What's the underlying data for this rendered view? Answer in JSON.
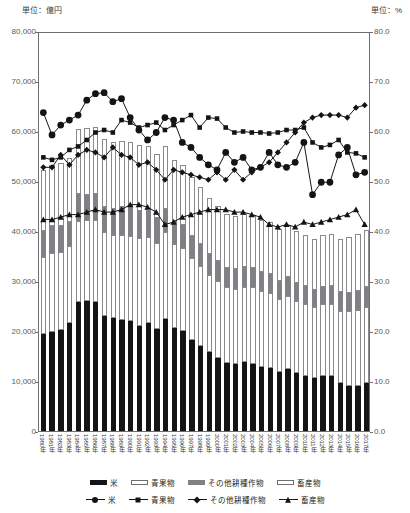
{
  "units": {
    "left": "単位：億円",
    "right": "単位：%"
  },
  "axes": {
    "left_ticks": [
      "0",
      "10,000",
      "20,000",
      "30,000",
      "40,000",
      "50,000",
      "60,000",
      "70,000",
      "80,000"
    ],
    "right_ticks": [
      "0.0",
      "10.0",
      "20.0",
      "30.0",
      "40.0",
      "50.0",
      "60.0",
      "70.0",
      "80.0"
    ]
  },
  "legend": {
    "bars": [
      {
        "label": "米",
        "swatch": "black-bar-icon"
      },
      {
        "label": "青果物",
        "swatch": "white-bar-icon"
      },
      {
        "label": "その他耕種作物",
        "swatch": "gray-bar-icon"
      },
      {
        "label": "畜産物",
        "swatch": "white-bar-icon"
      }
    ],
    "lines": [
      {
        "label": "米",
        "marker": "circle-marker-icon"
      },
      {
        "label": "青果物",
        "marker": "square-marker-icon"
      },
      {
        "label": "その他耕種作物",
        "marker": "diamond-marker-icon"
      },
      {
        "label": "畜産物",
        "marker": "triangle-marker-icon"
      }
    ]
  },
  "colors": {
    "rice": "#141414",
    "fruit_veg": "#ffffff",
    "other_crops": "#808184",
    "livestock": "#ffffff",
    "axis": "#6d6e71",
    "text": "#231f20"
  },
  "chart_data": {
    "type": "bar",
    "title": "",
    "xlabel": "",
    "ylabel": "億円",
    "ylim": [
      0,
      80000
    ],
    "y2lim": [
      0,
      80.0
    ],
    "grid": false,
    "legend_position": "bottom",
    "categories": [
      "1980年",
      "1981年",
      "1982年",
      "1983年",
      "1984年",
      "1985年",
      "1986年",
      "1987年",
      "1988年",
      "1989年",
      "1990年",
      "1991年",
      "1992年",
      "1993年",
      "1994年",
      "1995年",
      "1996年",
      "1997年",
      "1998年",
      "1999年",
      "2000年",
      "2001年",
      "2002年",
      "2003年",
      "2004年",
      "2005年",
      "2006年",
      "2007年",
      "2008年",
      "2009年",
      "2010年",
      "2011年",
      "2012年",
      "2013年",
      "2014年",
      "2015年",
      "2016年",
      "2017年"
    ],
    "bar_series": [
      {
        "name": "米",
        "stack": "total",
        "values": [
          19500,
          19900,
          20200,
          21700,
          25900,
          26000,
          25900,
          23000,
          22600,
          22300,
          22000,
          21100,
          21600,
          20500,
          22500,
          20600,
          20000,
          18200,
          17000,
          15900,
          14700,
          13700,
          13500,
          13800,
          13500,
          12900,
          12700,
          11800,
          12400,
          11700,
          11000,
          10600,
          11000,
          11000,
          9700,
          9100,
          9100,
          9600
        ]
      },
      {
        "name": "青果物",
        "stack": "total",
        "values": [
          15400,
          15800,
          15600,
          15300,
          16200,
          16300,
          16400,
          16800,
          16700,
          16900,
          17100,
          17600,
          17200,
          17100,
          17300,
          16900,
          16700,
          16400,
          16100,
          15400,
          15300,
          15100,
          15000,
          15100,
          15300,
          15100,
          15000,
          14600,
          14700,
          14400,
          14500,
          14200,
          14400,
          14500,
          14400,
          14900,
          15200,
          15300
        ]
      },
      {
        "name": "その他耕種作物",
        "stack": "total",
        "values": [
          5200,
          5300,
          5200,
          4800,
          5300,
          5000,
          5100,
          5000,
          5200,
          5600,
          5500,
          5400,
          5300,
          5100,
          4700,
          4600,
          4600,
          4500,
          4300,
          4100,
          4000,
          3900,
          3900,
          3900,
          3900,
          3800,
          3700,
          3600,
          3700,
          3600,
          3500,
          3400,
          3500,
          3600,
          3700,
          3700,
          3800,
          3900
        ]
      },
      {
        "name": "畜産物",
        "stack": "total",
        "values": [
          12100,
          12300,
          12600,
          12800,
          13000,
          13300,
          13500,
          13600,
          13400,
          13200,
          13300,
          13100,
          12900,
          12700,
          12500,
          12200,
          12000,
          11800,
          11500,
          11200,
          11000,
          10800,
          10700,
          10700,
          10600,
          10500,
          10400,
          10400,
          10500,
          10300,
          10300,
          10200,
          10300,
          10400,
          10600,
          11100,
          11400,
          11500
        ]
      }
    ],
    "line_series": [
      {
        "name": "米",
        "axis": "right",
        "marker": "circle",
        "values": [
          64.0,
          59.5,
          61.5,
          62.5,
          63.5,
          66.5,
          67.8,
          68.0,
          66.2,
          66.8,
          63.0,
          60.5,
          58.5,
          60.0,
          63.0,
          62.5,
          58.0,
          57.0,
          55.0,
          53.5,
          52.5,
          56.0,
          54.0,
          55.0,
          52.5,
          53.0,
          56.0,
          53.5,
          53.0,
          54.0,
          58.0,
          47.5,
          50.0,
          50.0,
          55.5,
          57.0,
          51.5,
          52.0
        ]
      },
      {
        "name": "青果物",
        "axis": "right",
        "marker": "square",
        "values": [
          55.0,
          54.5,
          55.0,
          56.5,
          57.2,
          58.5,
          60.0,
          60.5,
          60.0,
          62.5,
          62.0,
          61.0,
          61.5,
          62.0,
          60.5,
          61.5,
          62.5,
          63.5,
          61.0,
          63.0,
          62.8,
          61.0,
          60.0,
          60.2,
          60.0,
          60.0,
          59.8,
          60.0,
          60.5,
          60.5,
          61.0,
          58.0,
          57.0,
          57.5,
          58.5,
          56.0,
          55.8,
          55.0
        ]
      },
      {
        "name": "その他耕種作物",
        "axis": "right",
        "marker": "diamond",
        "values": [
          53.0,
          53.0,
          55.5,
          53.5,
          55.5,
          56.5,
          56.0,
          55.0,
          57.0,
          55.5,
          55.0,
          53.5,
          54.0,
          52.5,
          50.5,
          52.5,
          52.0,
          51.5,
          51.0,
          50.5,
          52.0,
          50.5,
          52.5,
          50.5,
          52.0,
          53.0,
          54.0,
          56.0,
          58.0,
          60.0,
          62.0,
          63.0,
          63.5,
          63.5,
          63.5,
          63.0,
          65.0,
          65.5
        ]
      },
      {
        "name": "畜産物",
        "axis": "right",
        "marker": "triangle",
        "values": [
          42.5,
          42.5,
          43.0,
          43.5,
          43.5,
          44.0,
          44.5,
          44.0,
          44.0,
          44.5,
          45.5,
          45.5,
          45.0,
          44.0,
          41.5,
          42.0,
          43.0,
          43.5,
          44.0,
          44.5,
          44.5,
          44.5,
          44.0,
          44.0,
          43.5,
          43.0,
          41.5,
          41.0,
          41.5,
          41.0,
          42.0,
          41.5,
          42.0,
          42.5,
          43.0,
          43.5,
          44.5,
          41.5
        ]
      }
    ]
  }
}
